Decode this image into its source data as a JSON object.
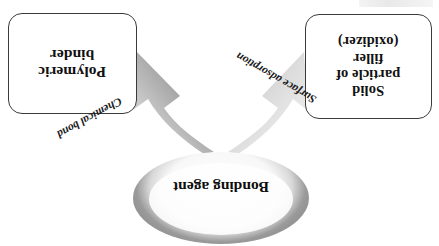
{
  "figure": {
    "orientation": "rotated-180",
    "background_color": "#ffffff"
  },
  "boxes": [
    {
      "name": "polymeric-binder",
      "lines": [
        "Polymeric",
        "binder"
      ],
      "text": "Polymeric binder",
      "border_color": "#3a3a3a",
      "fill_color": "#ffffff"
    },
    {
      "name": "solid-particle-filler",
      "lines": [
        "Solid",
        "particle of",
        "filler",
        "(oxidizer)"
      ],
      "text": "Solid particle of filler (oxidizer)",
      "border_color": "#3a3a3a",
      "fill_color": "#ffffff"
    }
  ],
  "arrows": [
    {
      "name": "chemical-bond-arrow",
      "label": "Chemical bond",
      "from": "Bonding agent",
      "to": "Polymeric binder",
      "color_dark": "#8c8c8c",
      "color_light": "#dcdcdc"
    },
    {
      "name": "surface-adsorption-arrow",
      "label": "Surface adsorption",
      "from": "Bonding agent",
      "to": "Solid particle of filler (oxidizer)",
      "color_dark": "#c9c9c9",
      "color_light": "#efefef"
    }
  ],
  "ellipse": {
    "name": "bonding-agent",
    "label": "Bonding agent",
    "ring_color": "#8d8d8d",
    "fill_color": "#fdfdfd"
  }
}
